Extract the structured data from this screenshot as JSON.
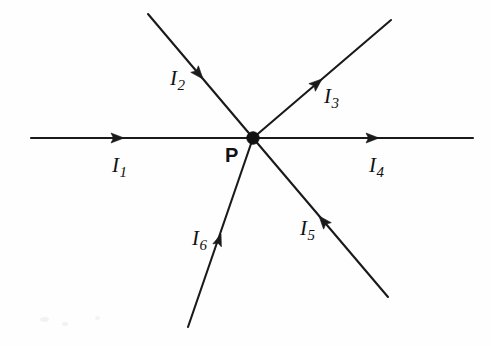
{
  "figure": {
    "background_color": "#fefefe",
    "stroke_color": "#1a1a1a",
    "junction": {
      "label": "P",
      "name": "junction-point-P",
      "x": 253,
      "y": 138
    },
    "branches": [
      {
        "id": "I1",
        "symbol": "I",
        "subscript": "1",
        "label_x": 112,
        "label_y": 155,
        "direction": "into-junction",
        "orientation": "horizontal-left",
        "start": [
          31,
          138
        ],
        "end": [
          253,
          138
        ],
        "arrow_at": [
          124,
          138
        ],
        "arrow_angle_deg": 0
      },
      {
        "id": "I2",
        "symbol": "I",
        "subscript": "2",
        "label_x": 170,
        "label_y": 68,
        "direction": "into-junction",
        "orientation": "upper-left-diagonal",
        "start": [
          148,
          14
        ],
        "end": [
          253,
          138
        ],
        "arrow_at": [
          203,
          79
        ],
        "arrow_angle_deg": 49.7
      },
      {
        "id": "I3",
        "symbol": "I",
        "subscript": "3",
        "label_x": 324,
        "label_y": 86,
        "direction": "out-of-junction",
        "orientation": "upper-right-diagonal",
        "start": [
          253,
          138
        ],
        "end": [
          391,
          20
        ],
        "arrow_at": [
          322,
          79
        ],
        "arrow_angle_deg": -40.5
      },
      {
        "id": "I4",
        "symbol": "I",
        "subscript": "4",
        "label_x": 369,
        "label_y": 155,
        "direction": "out-of-junction",
        "orientation": "horizontal-right",
        "start": [
          253,
          138
        ],
        "end": [
          473,
          138
        ],
        "arrow_at": [
          379,
          138
        ],
        "arrow_angle_deg": 0
      },
      {
        "id": "I5",
        "symbol": "I",
        "subscript": "5",
        "label_x": 300,
        "label_y": 218,
        "direction": "into-junction",
        "orientation": "lower-right-diagonal",
        "start": [
          388,
          297
        ],
        "end": [
          253,
          138
        ],
        "arrow_at": [
          319,
          216
        ],
        "arrow_angle_deg": 229.7
      },
      {
        "id": "I6",
        "symbol": "I",
        "subscript": "6",
        "label_x": 192,
        "label_y": 228,
        "direction": "out-of-junction",
        "orientation": "lower-left-diagonal",
        "start": [
          253,
          138
        ],
        "end": [
          188,
          327
        ],
        "arrow_at": [
          221,
          234
        ],
        "arrow_angle_deg": 109.0
      }
    ]
  }
}
